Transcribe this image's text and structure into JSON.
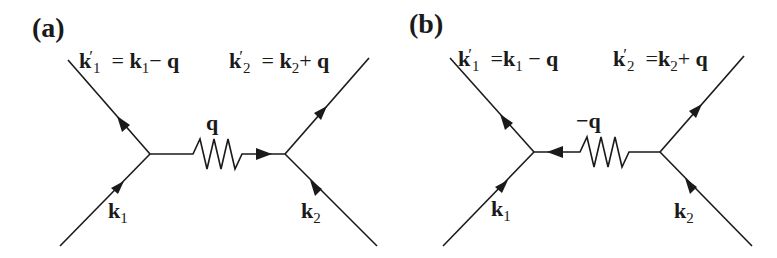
{
  "panels": [
    {
      "id": "a",
      "label": "(a)",
      "outgoing_left": {
        "symbol": "k",
        "prime": "′",
        "sub": "1",
        "eq": "=",
        "rhs_symbol": "k",
        "rhs_sub": "1",
        "op": "−",
        "rhs_q": "q"
      },
      "outgoing_right": {
        "symbol": "k",
        "prime": "′",
        "sub": "2",
        "eq": "=",
        "rhs_symbol": "k",
        "rhs_sub": "2",
        "op": "+",
        "rhs_q": "q"
      },
      "propagator_label": "q",
      "propagator_arrow": "right",
      "incoming_left": {
        "symbol": "k",
        "sub": "1"
      },
      "incoming_right": {
        "symbol": "k",
        "sub": "2"
      }
    },
    {
      "id": "b",
      "label": "(b)",
      "outgoing_left": {
        "symbol": "k",
        "prime": "′",
        "sub": "1",
        "eq": "=",
        "rhs_symbol": "k",
        "rhs_sub": "1",
        "op": "−",
        "rhs_q": "q"
      },
      "outgoing_right": {
        "symbol": "k",
        "prime": "′",
        "sub": "2",
        "eq": "=",
        "rhs_symbol": "k",
        "rhs_sub": "2",
        "op": "+",
        "rhs_q": "q"
      },
      "propagator_label": "−q",
      "propagator_arrow": "left",
      "incoming_left": {
        "symbol": "k",
        "sub": "1"
      },
      "incoming_right": {
        "symbol": "k",
        "sub": "2"
      }
    }
  ],
  "colors": {
    "line": "#1a1a1a",
    "background": "#ffffff"
  }
}
